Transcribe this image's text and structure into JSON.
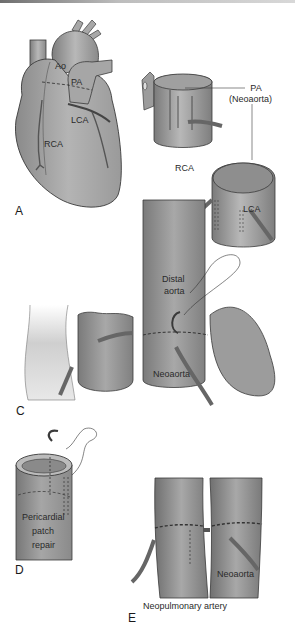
{
  "figure": {
    "panels": [
      {
        "id": "A",
        "label": "A",
        "annotations": [
          "Ao",
          "PA",
          "LCA",
          "RCA"
        ]
      },
      {
        "id": "B",
        "label": "B",
        "annotations": [
          "PA",
          "(Neoaorta)",
          "RCA",
          "LCA"
        ]
      },
      {
        "id": "C",
        "label": "C",
        "annotations": [
          "Distal",
          "aorta",
          "Neoaorta"
        ]
      },
      {
        "id": "D",
        "label": "D",
        "annotations": [
          "Pericardial",
          "patch",
          "repair"
        ]
      },
      {
        "id": "E",
        "label": "E",
        "annotations": [
          "Neoaorta",
          "Neopulmonary artery"
        ]
      }
    ],
    "colors": {
      "tissue": "#9a9a9a",
      "tissue_light": "#c4c4c4",
      "tissue_dark": "#6a6a6a",
      "outline": "#3a3a3a",
      "text": "#2a2a2a"
    }
  }
}
